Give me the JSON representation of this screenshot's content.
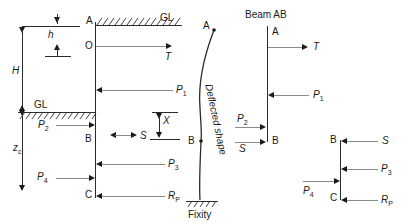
{
  "figure": {
    "title_beam_ab": "Beam AB",
    "deflected_shape_label": "Deflected shape",
    "fixity_label": "Fixity"
  },
  "main_diagram": {
    "points": {
      "a": "A",
      "o": "O",
      "b": "B",
      "c": "C"
    },
    "ground_line_top": "GL",
    "ground_line_left": "GL",
    "dimensions": {
      "h": "h",
      "big_h": "H",
      "zc": "z",
      "zc_sub": "c",
      "x": "X"
    },
    "forces": {
      "t": "T",
      "p1": "P",
      "p1_sub": "1",
      "p2": "P",
      "p2_sub": "2",
      "p3": "P",
      "p3_sub": "3",
      "p4": "P",
      "p4_sub": "4",
      "rp": "R",
      "rp_sub": "P",
      "s": "S"
    }
  },
  "beam_ab": {
    "points": {
      "a": "A",
      "b": "B"
    },
    "forces": {
      "t": "T",
      "p1": "P",
      "p1_sub": "1",
      "p2": "P",
      "p2_sub": "2",
      "s": "S"
    }
  },
  "beam_bc": {
    "points": {
      "b": "B",
      "c": "C"
    },
    "forces": {
      "s": "S",
      "p3": "P",
      "p3_sub": "3",
      "p4": "P",
      "p4_sub": "4",
      "rp": "R",
      "rp_sub": "P"
    }
  },
  "colors": {
    "ink": "#1a1a1a",
    "arrow_line": "#8a8a8a",
    "structure_line": "#2b2b2b",
    "background": "#ffffff"
  }
}
